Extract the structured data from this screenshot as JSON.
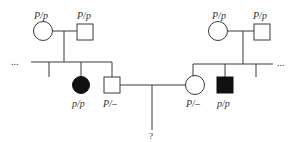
{
  "diagram": {
    "type": "pedigree",
    "colors": {
      "line": "#3a3a3a",
      "affected": "#111111",
      "unaffected": "#ffffff"
    },
    "left_family": {
      "grandmother": {
        "shape": "circle",
        "affected": false,
        "genotype": "P/p"
      },
      "grandfather": {
        "shape": "square",
        "affected": false,
        "genotype": "P/p"
      },
      "ellipsis": "...",
      "children": [
        {
          "shape": "unknown",
          "note": "sibling line stub"
        },
        {
          "shape": "circle",
          "affected": true,
          "genotype": "p/p"
        },
        {
          "shape": "square",
          "affected": false,
          "genotype": "P/–"
        }
      ]
    },
    "right_family": {
      "grandmother": {
        "shape": "circle",
        "affected": false,
        "genotype": "P/p"
      },
      "grandfather": {
        "shape": "square",
        "affected": false,
        "genotype": "P/p"
      },
      "ellipsis": "...",
      "children": [
        {
          "shape": "circle",
          "affected": false,
          "genotype": "P/–"
        },
        {
          "shape": "square",
          "affected": true,
          "genotype": "p/p"
        },
        {
          "shape": "unknown",
          "note": "sibling line stub"
        }
      ]
    },
    "offspring": {
      "label": "?"
    }
  }
}
